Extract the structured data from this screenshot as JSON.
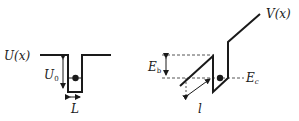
{
  "left_diagram": {
    "potential_label": "U(x)",
    "depth_label": "U",
    "depth_subscript": "0",
    "width_label": "L"
  },
  "right_diagram": {
    "potential_label": "V(x)",
    "barrier_label": "E",
    "barrier_subscript": "b",
    "energy_label": "E",
    "energy_subscript": "c",
    "length_label": "l"
  },
  "colors": {
    "line": "#1a1a1a",
    "dashed": "#555555",
    "background": "#ffffff"
  }
}
